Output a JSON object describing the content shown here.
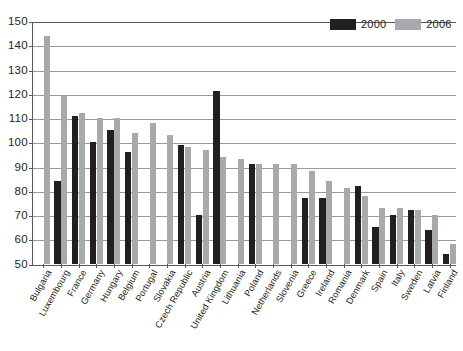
{
  "title_partial": "",
  "source_partial": "",
  "legend": {
    "position": "top-right",
    "entries": [
      {
        "label": "2000",
        "color": "#231f20"
      },
      {
        "label": "2006",
        "color": "#a7a9ac"
      }
    ]
  },
  "axis": {
    "y_ticks": [
      "150",
      "140",
      "130",
      "120",
      "110",
      "100",
      "90",
      "80",
      "70",
      "60",
      "50"
    ]
  },
  "chart_data": {
    "type": "bar",
    "title": "",
    "xlabel": "",
    "ylabel": "",
    "ylim": [
      50,
      150
    ],
    "ytick_step": 10,
    "grid": true,
    "legend_position": "top-right",
    "categories": [
      "Bulgaria",
      "Luxembourg",
      "France",
      "Germany",
      "Hungary",
      "Belgium",
      "Portugal",
      "Slovakia",
      "Czech Republic",
      "Austria",
      "United Kingdom",
      "Lithuania",
      "Poland",
      "Netherlands",
      "Slovenia",
      "Greece",
      "Ireland",
      "Romania",
      "Denmark",
      "Spain",
      "Italy",
      "Sweden",
      "Latvia",
      "Finland"
    ],
    "series": [
      {
        "name": "2000",
        "color": "#231f20",
        "values": [
          null,
          84,
          111,
          100,
          105,
          96,
          null,
          null,
          99,
          70,
          121,
          null,
          91,
          null,
          null,
          77,
          77,
          null,
          82,
          65,
          70,
          72,
          64,
          54
        ]
      },
      {
        "name": "2006",
        "color": "#a7a9ac",
        "values": [
          144,
          119,
          112,
          110,
          110,
          104,
          108,
          103,
          98,
          97,
          94,
          93,
          91,
          91,
          91,
          88,
          84,
          81,
          78,
          73,
          73,
          72,
          70,
          58
        ]
      }
    ]
  }
}
